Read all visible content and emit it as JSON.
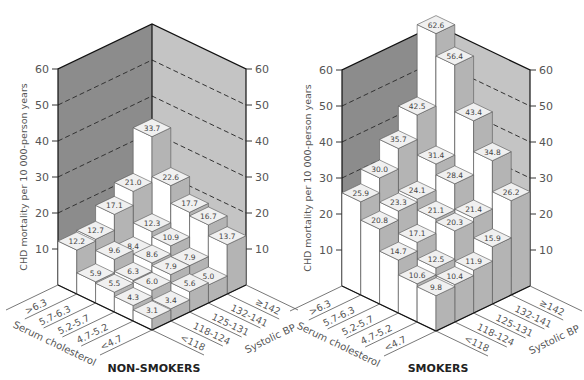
{
  "chart_data": [
    {
      "type": "bar3d",
      "title": "NON-SMOKERS",
      "ylabel": "CHD mortality per 10 000-person years",
      "ylim": [
        0,
        60
      ],
      "yticks": [
        10,
        20,
        30,
        40,
        50,
        60
      ],
      "x_axis_name": "Serum cholesterol",
      "z_axis_name": "Systolic BP",
      "cholesterol_categories": [
        "<4.7",
        "4.7-5.2",
        "5.2-5.7",
        "5.7-6.3",
        ">6.3"
      ],
      "bp_categories": [
        "<118",
        "118-124",
        "125-131",
        "132-141",
        "≥142"
      ],
      "values": [
        [
          3.1,
          3.4,
          5.6,
          5.0,
          13.7
        ],
        [
          4.3,
          6.0,
          7.9,
          7.9,
          16.7
        ],
        [
          5.5,
          6.3,
          8.6,
          10.9,
          17.7
        ],
        [
          5.9,
          9.6,
          8.4,
          12.3,
          22.6
        ],
        [
          12.2,
          12.7,
          17.1,
          21.0,
          33.7
        ]
      ],
      "grid": "dashed at 30, 40, 50 (back walls)"
    },
    {
      "type": "bar3d",
      "title": "SMOKERS",
      "ylabel": "CHD mortality per 10 000-person years",
      "ylim": [
        0,
        60
      ],
      "yticks": [
        10,
        20,
        30,
        40,
        50,
        60
      ],
      "x_axis_name": "Serum cholesterol",
      "z_axis_name": "Systolic BP",
      "cholesterol_categories": [
        "<4.7",
        "4.7-5.2",
        "5.2-5.7",
        "5.7-6.3",
        ">6.3"
      ],
      "bp_categories": [
        "<118",
        "118-124",
        "125-131",
        "132-141",
        "≥142"
      ],
      "values": [
        [
          9.8,
          10.4,
          11.9,
          15.9,
          26.2
        ],
        [
          10.6,
          12.5,
          20.3,
          21.4,
          34.8
        ],
        [
          14.7,
          17.1,
          21.1,
          28.4,
          43.4
        ],
        [
          20.8,
          23.3,
          24.1,
          31.4,
          56.4
        ],
        [
          25.9,
          30.0,
          35.7,
          42.5,
          62.6
        ]
      ],
      "grid": "dashed at 30, 40, 50 (back walls)"
    }
  ],
  "panels": [
    {
      "title": "NON-SMOKERS",
      "left_x": 58,
      "right_x": 246,
      "front_x": 152,
      "base_y": 285,
      "front_y": 330,
      "px_per_unit": 3.6
    },
    {
      "title": "SMOKERS",
      "left_x": 342,
      "right_x": 530,
      "front_x": 436,
      "base_y": 286,
      "front_y": 331,
      "px_per_unit": 3.6
    }
  ],
  "colors": {
    "left_wall": "#8c8c8c",
    "right_wall": "#c4c4c4",
    "bar_front": "#ffffff",
    "bar_side": "#b4b4b4",
    "bar_top": "#f0f0f0",
    "edge": "#555555"
  }
}
